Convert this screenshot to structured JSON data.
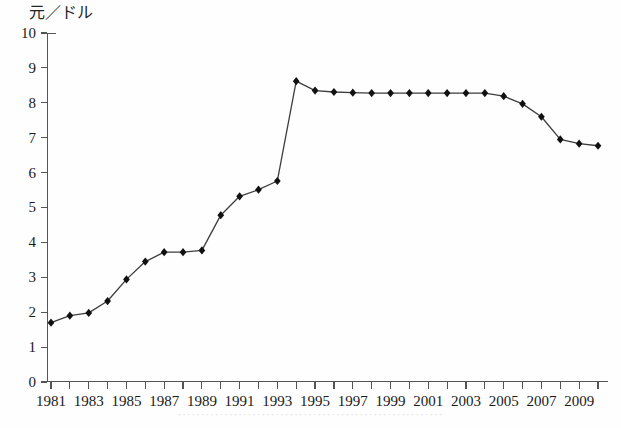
{
  "chart_data": {
    "type": "line",
    "title": "",
    "subtitle": "",
    "ylabel": "元／ドル",
    "xlabel": "",
    "ylim": [
      0,
      10
    ],
    "xlim": [
      1981,
      2010
    ],
    "grid": false,
    "legend": null,
    "marker": "diamond",
    "line_color": "#3d3d3d",
    "marker_color": "#111111",
    "y_ticks": [
      "0",
      "1",
      "2",
      "3",
      "4",
      "5",
      "6",
      "7",
      "8",
      "9",
      "10"
    ],
    "y_tick_values": [
      0,
      1,
      2,
      3,
      4,
      5,
      6,
      7,
      8,
      9,
      10
    ],
    "x_ticks_all": [
      1981,
      1982,
      1983,
      1984,
      1985,
      1986,
      1987,
      1988,
      1989,
      1990,
      1991,
      1992,
      1993,
      1994,
      1995,
      1996,
      1997,
      1998,
      1999,
      2000,
      2001,
      2002,
      2003,
      2004,
      2005,
      2006,
      2007,
      2008,
      2009,
      2010
    ],
    "x_tick_labels": [
      "1981",
      "1983",
      "1985",
      "1987",
      "1989",
      "1991",
      "1993",
      "1995",
      "1997",
      "1999",
      "2001",
      "2003",
      "2005",
      "2007",
      "2009"
    ],
    "x_tick_label_values": [
      1981,
      1983,
      1985,
      1987,
      1989,
      1991,
      1993,
      1995,
      1997,
      1999,
      2001,
      2003,
      2005,
      2007,
      2009
    ],
    "x": [
      1981,
      1982,
      1983,
      1984,
      1985,
      1986,
      1987,
      1988,
      1989,
      1990,
      1991,
      1992,
      1993,
      1994,
      1995,
      1996,
      1997,
      1998,
      1999,
      2000,
      2001,
      2002,
      2003,
      2004,
      2005,
      2006,
      2007,
      2008,
      2009,
      2010
    ],
    "values": [
      1.7,
      1.9,
      1.98,
      2.32,
      2.94,
      3.45,
      3.72,
      3.72,
      3.77,
      4.78,
      5.32,
      5.51,
      5.76,
      8.62,
      8.35,
      8.31,
      8.29,
      8.28,
      8.28,
      8.28,
      8.28,
      8.28,
      8.28,
      8.28,
      8.19,
      7.97,
      7.6,
      6.95,
      6.83,
      6.77
    ],
    "series": [
      {
        "name": "元／ドル",
        "values": [
          1.7,
          1.9,
          1.98,
          2.32,
          2.94,
          3.45,
          3.72,
          3.72,
          3.77,
          4.78,
          5.32,
          5.51,
          5.76,
          8.62,
          8.35,
          8.31,
          8.29,
          8.28,
          8.28,
          8.28,
          8.28,
          8.28,
          8.28,
          8.28,
          8.19,
          7.97,
          7.6,
          6.95,
          6.83,
          6.77
        ]
      }
    ],
    "annotations": []
  },
  "figure": {
    "caption_faint": "·························································"
  }
}
